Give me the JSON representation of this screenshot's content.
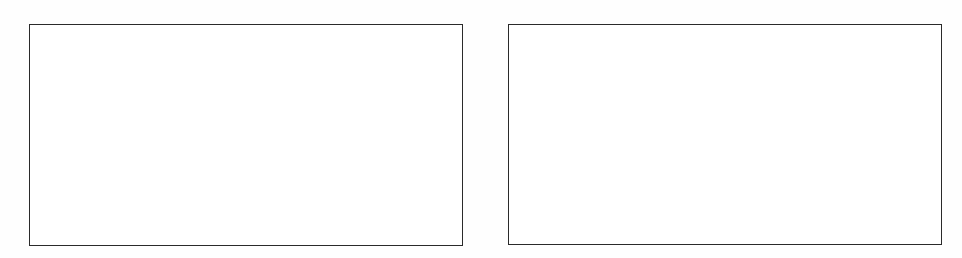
{
  "page": {
    "background_color": "#fefefe",
    "width_px": 962,
    "height_px": 258
  },
  "figure": {
    "kind": "scanned-figure",
    "panel_count": 2,
    "border_color": "#2a2a2a",
    "border_width_px": 1.5,
    "fill_color": "#ffffff",
    "panels": [
      {
        "id": "panel-left",
        "label": "",
        "caption": "",
        "content": "",
        "x": 29,
        "y": 24,
        "width": 434,
        "height": 222
      },
      {
        "id": "panel-right",
        "label": "",
        "caption": "",
        "content": "",
        "x": 508,
        "y": 24,
        "width": 434,
        "height": 221
      }
    ]
  }
}
